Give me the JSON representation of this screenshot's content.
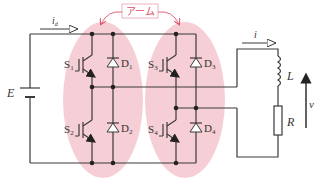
{
  "diagram": {
    "title_annotation": "アーム",
    "colors": {
      "wire": "#3a3a3a",
      "arm_highlight": "#f5c6ce",
      "annotation": "#e0506a"
    },
    "source": {
      "label": "E"
    },
    "currents": {
      "input": "i",
      "input_sub": "d",
      "output": "i"
    },
    "switches": [
      {
        "name": "S",
        "sub": "1"
      },
      {
        "name": "S",
        "sub": "2"
      },
      {
        "name": "S",
        "sub": "3"
      },
      {
        "name": "S",
        "sub": "4"
      }
    ],
    "diodes": [
      {
        "name": "D",
        "sub": "1"
      },
      {
        "name": "D",
        "sub": "2"
      },
      {
        "name": "D",
        "sub": "3"
      },
      {
        "name": "D",
        "sub": "4"
      }
    ],
    "load": {
      "inductor": "L",
      "resistor": "R",
      "voltage": "v"
    }
  }
}
